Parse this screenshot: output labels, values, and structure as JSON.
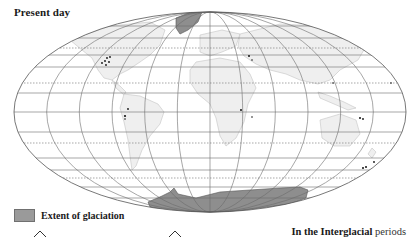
{
  "title": "Present day",
  "legend": {
    "label": "Extent of glaciation",
    "swatch_color": "#9a9a9a"
  },
  "caption": {
    "bold": "In the Interglacial",
    "rest": " periods"
  },
  "colors": {
    "grid": "#6b6b6b",
    "land": "#efefef",
    "land_outline": "#c4c4c4",
    "glaciation": "#8e8e8e",
    "glacier_dots": "#111111"
  },
  "map": {
    "projection": "elliptical equal-area (Mollweide-style)",
    "meridian_spacing_deg": 30,
    "glaciated_regions": [
      "Greenland",
      "Antarctica"
    ],
    "mountain_glacier_markers": [
      "Western North America",
      "Andes",
      "Alps",
      "East Africa",
      "Himalaya",
      "New Guinea",
      "New Zealand"
    ]
  },
  "icons": [
    "caret-up-icon",
    "caret-up-icon"
  ]
}
